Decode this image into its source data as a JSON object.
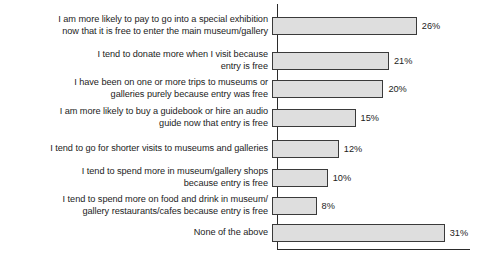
{
  "chart_data": {
    "type": "bar",
    "orientation": "horizontal",
    "title": "",
    "xlabel": "",
    "ylabel": "",
    "xlim": [
      0,
      35
    ],
    "grid": false,
    "legend": false,
    "value_suffix": "%",
    "categories": [
      "I am more likely to pay to go into a special exhibition\nnow that it is free to enter the main museum/gallery",
      "I tend to donate more when I visit because\nentry is free",
      "I have been on one or more trips to museums or\ngalleries purely because entry was free",
      "I am more likely to buy a guidebook or hire an audio\nguide now that entry is free",
      "I tend to go for shorter visits to museums and galleries",
      "I tend to spend more in museum/gallery shops\nbecause entry is free",
      "I tend to spend more on food and drink in museum/\ngallery restaurants/cafes because entry is free",
      "None of the above"
    ],
    "values": [
      26,
      21,
      20,
      15,
      12,
      10,
      8,
      31
    ],
    "value_labels": [
      "26%",
      "21%",
      "20%",
      "15%",
      "12%",
      "10%",
      "8%",
      "31%"
    ],
    "bar_fill_color": "#dedede",
    "bar_border_color": "#3a3a3a",
    "axis_color": "#2b2b2b",
    "background_color": "#ffffff"
  },
  "layout": {
    "px_per_percent": 5.57,
    "rows_top": [
      14,
      49,
      77,
      106,
      140,
      166,
      194,
      224
    ],
    "label_column_width": 272,
    "axis_left": 277
  }
}
